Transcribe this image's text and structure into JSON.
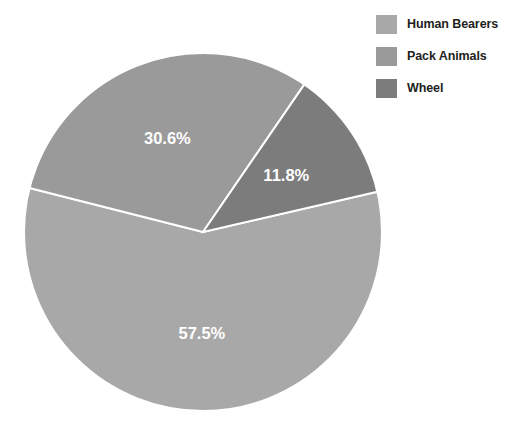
{
  "chart_data": {
    "type": "pie",
    "title": "",
    "subtitle": "",
    "xlabel": "",
    "ylabel": "",
    "grid": false,
    "legend_position": "top-right",
    "categories": [
      "Human Bearers",
      "Pack Animals",
      "Wheel"
    ],
    "values": [
      57.5,
      30.6,
      11.8
    ],
    "labels": [
      "57.5%",
      "30.6%",
      "11.8%"
    ],
    "colors": [
      "#a8a8a8",
      "#9a9a9a",
      "#7c7c7c"
    ],
    "slice_border_color": "#ffffff",
    "label_text_color": "#ffffff",
    "start_angle_deg": -13,
    "direction": "clockwise",
    "slices": [
      {
        "name": "Human Bearers",
        "value": 57.5,
        "label": "57.5%",
        "color": "#a8a8a8"
      },
      {
        "name": "Pack Animals",
        "value": 30.6,
        "label": "30.6%",
        "color": "#9a9a9a"
      },
      {
        "name": "Wheel",
        "value": 11.8,
        "label": "11.8%",
        "color": "#7c7c7c"
      }
    ]
  },
  "legend": {
    "items": [
      {
        "label": "Human Bearers",
        "color": "#a8a8a8"
      },
      {
        "label": "Pack Animals",
        "color": "#9a9a9a"
      },
      {
        "label": "Wheel",
        "color": "#7c7c7c"
      }
    ]
  }
}
